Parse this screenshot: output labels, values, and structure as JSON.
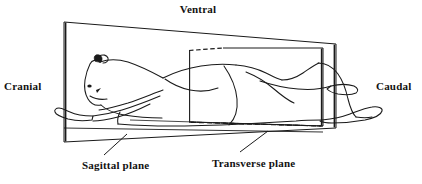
{
  "figure": {
    "stroke_color": "#1a1a1a",
    "background_color": "#ffffff",
    "labels": {
      "ventral": "Ventral",
      "cranial": "Cranial",
      "caudal": "Caudal",
      "sagittal_plane": "Sagittal plane",
      "transverse_plane": "Transverse plane"
    },
    "planes": [
      {
        "name": "sagittal-plane",
        "label": "Sagittal plane",
        "orientation": "vertical-longitudinal",
        "edge_style": "solid-outline-with-thick-vertical-ends"
      },
      {
        "name": "transverse-plane",
        "label": "Transverse plane",
        "orientation": "vertical-cross-sectional",
        "edge_style": "solid-outline-with-dashed-hidden-edges"
      }
    ],
    "direction_terms": [
      {
        "name": "ventral",
        "label": "Ventral",
        "position": "top"
      },
      {
        "name": "cranial",
        "label": "Cranial",
        "position": "left"
      },
      {
        "name": "caudal",
        "label": "Caudal",
        "position": "right"
      }
    ],
    "leader_lines": [
      {
        "name": "sagittal-leader",
        "from": "Sagittal plane",
        "to": "sagittal-plane-surface"
      },
      {
        "name": "transverse-leader",
        "from": "Transverse plane",
        "to": "transverse-plane-surface"
      }
    ]
  }
}
